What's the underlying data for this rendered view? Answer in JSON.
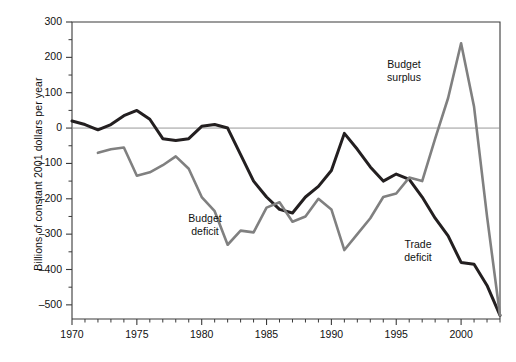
{
  "chart_data": {
    "type": "line",
    "title": "",
    "xlabel": "",
    "ylabel": "Billions of constant 2001 dollars per year",
    "xlim": [
      1970,
      2003
    ],
    "ylim": [
      -540,
      300
    ],
    "ytick_values": [
      300,
      200,
      100,
      0,
      -100,
      -200,
      -300,
      -400,
      -500
    ],
    "ytick_labels": [
      "300",
      "200",
      "100",
      "0",
      "–100",
      "–200",
      "–300",
      "–400",
      "–500"
    ],
    "ytick_minor_step": 50,
    "xtick_values": [
      1970,
      1975,
      1980,
      1985,
      1990,
      1995,
      2000
    ],
    "xtick_labels": [
      "1970",
      "1975",
      "1980",
      "1985",
      "1990",
      "1995",
      "2000"
    ],
    "xtick_minor_step": 1,
    "grid": false,
    "legend_position": "none",
    "zero_line": 0,
    "series": [
      {
        "name": "Trade deficit",
        "color": "#231f20",
        "width": 3.0,
        "x": [
          1970,
          1971,
          1972,
          1973,
          1974,
          1975,
          1976,
          1977,
          1978,
          1979,
          1980,
          1981,
          1982,
          1983,
          1984,
          1985,
          1986,
          1987,
          1988,
          1989,
          1990,
          1991,
          1992,
          1993,
          1994,
          1995,
          1996,
          1997,
          1998,
          1999,
          2000,
          2001,
          2002,
          2003
        ],
        "values": [
          20,
          10,
          -5,
          10,
          35,
          50,
          25,
          -30,
          -35,
          -30,
          5,
          10,
          0,
          -75,
          -150,
          -195,
          -230,
          -240,
          -195,
          -165,
          -120,
          -15,
          -60,
          -110,
          -150,
          -130,
          -145,
          -195,
          -255,
          -305,
          -380,
          -385,
          -445,
          -530
        ]
      },
      {
        "name": "Budget deficit",
        "color": "#808080",
        "width": 2.6,
        "x": [
          1972,
          1973,
          1974,
          1975,
          1976,
          1977,
          1978,
          1979,
          1980,
          1981,
          1982,
          1983,
          1984,
          1985,
          1986,
          1987,
          1988,
          1989,
          1990,
          1991,
          1992,
          1993,
          1994,
          1995,
          1996,
          1997,
          1998,
          1999,
          2000,
          2001,
          2002,
          2003
        ],
        "values": [
          -70,
          -60,
          -55,
          -135,
          -125,
          -105,
          -80,
          -115,
          -195,
          -235,
          -330,
          -290,
          -295,
          -225,
          -210,
          -265,
          -250,
          -200,
          -230,
          -345,
          -300,
          -255,
          -195,
          -185,
          -140,
          -150,
          -30,
          85,
          240,
          60,
          -250,
          -530
        ]
      }
    ],
    "annotations": [
      {
        "name": "budget-surplus-label",
        "text_line1": "Budget",
        "text_line2": "surplus",
        "x_px": 404,
        "y_px": 58
      },
      {
        "name": "budget-deficit-label",
        "text_line1": "Budget",
        "text_line2": "deficit",
        "x_px": 205,
        "y_px": 212
      },
      {
        "name": "trade-deficit-label",
        "text_line1": "Trade",
        "text_line2": "deficit",
        "x_px": 418,
        "y_px": 238
      }
    ]
  },
  "axis": {
    "y_label": "Billions of constant 2001 dollars per year",
    "y_ticks": [
      "300",
      "200",
      "100",
      "0",
      "–100",
      "–200",
      "–300",
      "–400",
      "–500"
    ],
    "x_ticks": [
      "1970",
      "1975",
      "1980",
      "1985",
      "1990",
      "1995",
      "2000"
    ]
  },
  "colors": {
    "trade_line": "#231f20",
    "budget_line": "#808080",
    "frame": "#3a3a3a",
    "zero_line": "#8c8c8c",
    "text": "#111111",
    "background": "#ffffff"
  }
}
